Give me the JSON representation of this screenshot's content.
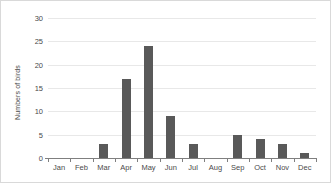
{
  "chart_data": {
    "type": "bar",
    "title": "",
    "xlabel": "",
    "ylabel": "Numbers of birds",
    "categories": [
      "Jan",
      "Feb",
      "Mar",
      "Apr",
      "May",
      "Jun",
      "Jul",
      "Aug",
      "Sep",
      "Oct",
      "Nov",
      "Dec"
    ],
    "values": [
      0,
      0,
      3,
      17,
      24,
      9,
      3,
      0,
      5,
      4,
      3,
      1
    ],
    "series": [
      {
        "name": "Numbers of birds",
        "values": [
          0,
          0,
          3,
          17,
          24,
          9,
          3,
          0,
          5,
          4,
          3,
          1
        ]
      }
    ],
    "ylim": [
      0,
      30
    ],
    "ytick_labels": [
      "0",
      "5",
      "10",
      "15",
      "20",
      "25",
      "30"
    ],
    "ytick_values": [
      0,
      5,
      10,
      15,
      20,
      25,
      30
    ],
    "grid": "horizontal",
    "legend": "none",
    "bar_color": "#595959",
    "gridline_color": "#e8e8e8",
    "axis_color": "#7f7f7f",
    "border_color": "#d9d9d9",
    "background_color": "#ffffff"
  }
}
